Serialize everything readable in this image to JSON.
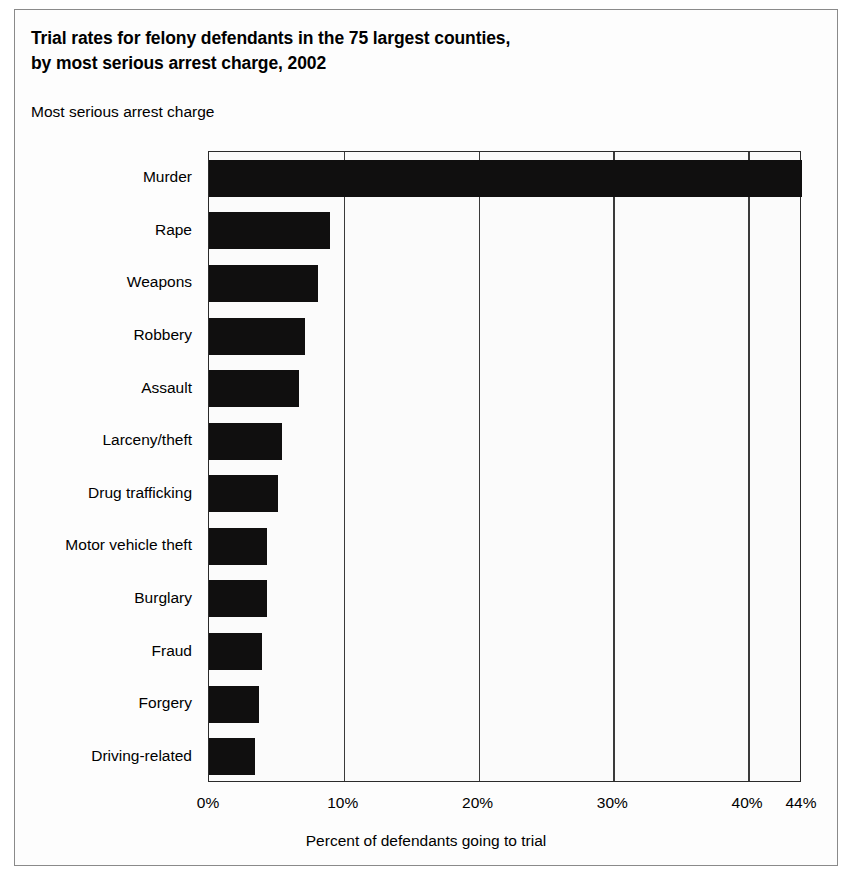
{
  "figure": {
    "title_line1": "Trial rates for felony defendants in the 75 largest counties,",
    "title_line2": "by most serious arrest charge, 2002",
    "category_axis_heading": "Most serious arrest charge",
    "xaxis_title": "Percent of defendants going to trial",
    "bar_color": "#100f0f",
    "frame_color": "#8a8a8a",
    "grid_color": "#3a3a3a"
  },
  "chart_data": {
    "type": "bar",
    "orientation": "horizontal",
    "title": "Trial rates for felony defendants in the 75 largest counties, by most serious arrest charge, 2002",
    "subtitle": "",
    "xlabel": "Percent of defendants going to trial",
    "ylabel": "Most serious arrest charge",
    "xlim": [
      0,
      44
    ],
    "xticks": [
      0,
      10,
      20,
      30,
      40,
      44
    ],
    "xticklabels": [
      "0%",
      "10%",
      "20%",
      "30%",
      "40%",
      "44%"
    ],
    "grid": "vertical",
    "legend": "none",
    "categories": [
      "Murder",
      "Rape",
      "Weapons",
      "Robbery",
      "Assault",
      "Larceny/theft",
      "Drug trafficking",
      "Motor vehicle theft",
      "Burglary",
      "Fraud",
      "Forgery",
      "Driving-related"
    ],
    "values": [
      44,
      9,
      8.1,
      7.1,
      6.7,
      5.4,
      5.1,
      4.3,
      4.3,
      3.9,
      3.7,
      3.4
    ],
    "value_unit": "%"
  }
}
